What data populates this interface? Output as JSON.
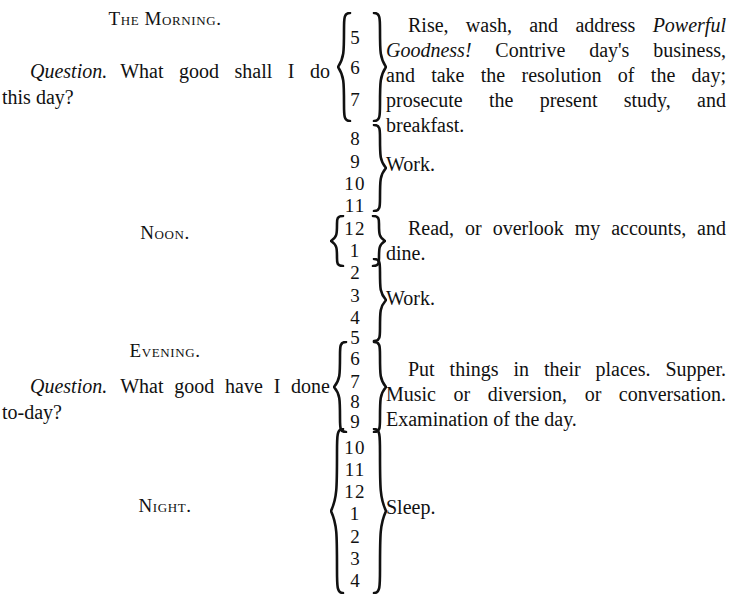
{
  "document": {
    "title": "The Morning Scheme",
    "background_color": "#ffffff",
    "text_color": "#111111"
  },
  "sections": [
    {
      "id": "morning",
      "heading": "The Morning.",
      "question_label": "Question.",
      "question_line_1": "What good shall I do",
      "question_line_2": "this day?",
      "hours": [
        "5",
        "6",
        "7"
      ],
      "brace_left": true,
      "brace_right": true,
      "entry_lines": [
        "Rise, wash, and address Powerful",
        "Goodness! Contrive day's business,",
        "and take the resolution of the day;",
        "prosecute the present study, and",
        "breakfast."
      ],
      "entry_text": "Rise, wash, and address Powerful Goodness! Contrive day's business, and take the resolution of the day; prosecute the present study, and breakfast.",
      "italic_phrase": "Powerful Goodness!"
    },
    {
      "id": "morning-work",
      "heading": "",
      "hours": [
        "8",
        "9",
        "10",
        "11"
      ],
      "brace_left": false,
      "brace_right": true,
      "entry_lines": [
        "Work."
      ],
      "entry_text": "Work."
    },
    {
      "id": "noon",
      "heading": "Noon.",
      "hours": [
        "12",
        "1"
      ],
      "brace_left": true,
      "brace_right": true,
      "entry_lines": [
        "Read, or overlook my accounts, and",
        "dine."
      ],
      "entry_text": "Read, or overlook my accounts, and dine."
    },
    {
      "id": "afternoon-work",
      "heading": "",
      "hours": [
        "2",
        "3",
        "4",
        "5"
      ],
      "brace_left": false,
      "brace_right": true,
      "entry_lines": [
        "Work."
      ],
      "entry_text": "Work."
    },
    {
      "id": "evening",
      "heading": "Evening.",
      "question_label": "Question.",
      "question_line_1": "What good have I done",
      "question_line_2": "to-day?",
      "hours": [
        "6",
        "7",
        "8",
        "9"
      ],
      "brace_left": true,
      "brace_right": true,
      "entry_lines": [
        "Put things in their places.  Supper.",
        "Music or diversion, or conversation.",
        "Examination of the day."
      ],
      "entry_text": "Put things in their places. Supper. Music or diversion, or conversation. Examination of the day."
    },
    {
      "id": "night",
      "heading": "Night.",
      "hours": [
        "10",
        "11",
        "12",
        "1",
        "2",
        "3",
        "4"
      ],
      "brace_left": true,
      "brace_right": true,
      "entry_lines": [
        "Sleep."
      ],
      "entry_text": "Sleep."
    }
  ],
  "hour_marks": [
    {
      "value": "5",
      "top": 28
    },
    {
      "value": "6",
      "top": 58
    },
    {
      "value": "7",
      "top": 90
    },
    {
      "value": "8",
      "top": 129
    },
    {
      "value": "9",
      "top": 152
    },
    {
      "value": "10",
      "top": 174
    },
    {
      "value": "11",
      "top": 196
    },
    {
      "value": "12",
      "top": 219
    },
    {
      "value": "1",
      "top": 241
    },
    {
      "value": "2",
      "top": 263
    },
    {
      "value": "3",
      "top": 286
    },
    {
      "value": "4",
      "top": 308
    },
    {
      "value": "5",
      "top": 328
    },
    {
      "value": "6",
      "top": 349
    },
    {
      "value": "7",
      "top": 372
    },
    {
      "value": "8",
      "top": 392
    },
    {
      "value": "9",
      "top": 412
    },
    {
      "value": "10",
      "top": 438
    },
    {
      "value": "11",
      "top": 460
    },
    {
      "value": "12",
      "top": 482
    },
    {
      "value": "1",
      "top": 504
    },
    {
      "value": "2",
      "top": 527
    },
    {
      "value": "3",
      "top": 549
    },
    {
      "value": "4",
      "top": 571
    }
  ]
}
